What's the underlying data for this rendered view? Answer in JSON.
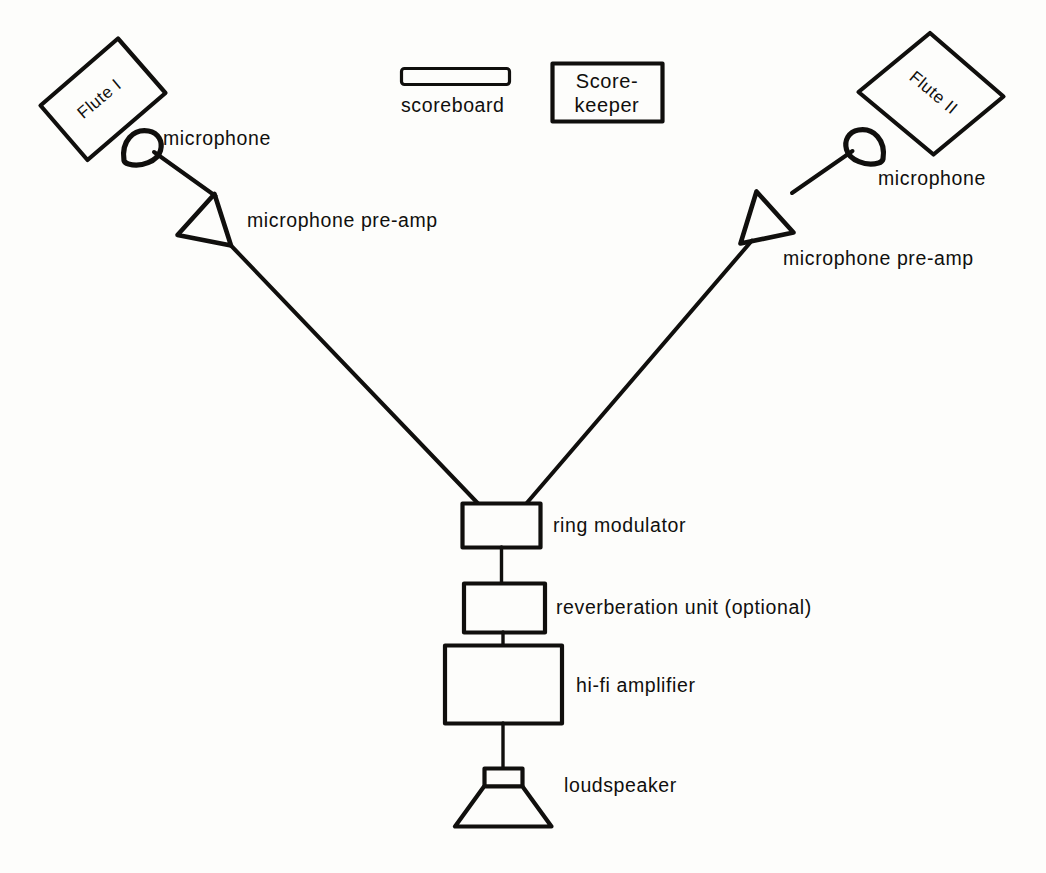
{
  "diagram": {
    "ink_color": "#100f0d",
    "paper_color": "#fdfdfb",
    "sources": [
      {
        "id": "flute-1",
        "label": "Flute I",
        "rotation_deg": -35
      },
      {
        "id": "flute-2",
        "label": "Flute II",
        "rotation_deg": 35
      }
    ],
    "microphones": [
      {
        "id": "microphone-left",
        "label": "microphone"
      },
      {
        "id": "microphone-right",
        "label": "microphone"
      }
    ],
    "preamps": [
      {
        "id": "preamp-left",
        "label": "microphone pre-amp"
      },
      {
        "id": "preamp-right",
        "label": "microphone pre-amp"
      }
    ],
    "chain": [
      {
        "id": "ring-modulator",
        "label": "ring modulator"
      },
      {
        "id": "reverberation-unit",
        "label": "reverberation unit (optional)"
      },
      {
        "id": "hifi-amplifier",
        "label": "hi-fi amplifier"
      },
      {
        "id": "loudspeaker",
        "label": "loudspeaker"
      }
    ],
    "accessories": [
      {
        "id": "scoreboard",
        "label": "scoreboard"
      },
      {
        "id": "scorekeeper",
        "label_line_1": "Score-",
        "label_line_2": "keeper"
      }
    ]
  }
}
